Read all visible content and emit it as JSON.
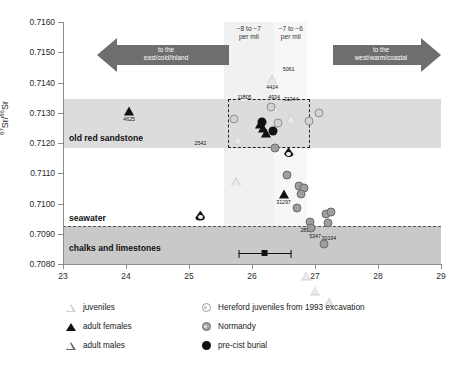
{
  "chart_data": {
    "type": "scatter",
    "title": "",
    "xlabel": "",
    "ylabel": "87Sr/86Sr",
    "ylabel_parts": {
      "pre1": "87",
      "main1": "Sr",
      "sep": "/ ",
      "pre2": "86",
      "main2": "Sr"
    },
    "xlim": [
      23,
      29
    ],
    "ylim": [
      0.708,
      0.716
    ],
    "xticks": [
      "23",
      "24",
      "25",
      "26",
      "27",
      "28",
      "29"
    ],
    "xtick_values": [
      23,
      24,
      25,
      26,
      27,
      28,
      29
    ],
    "yticks": [
      "0.7080",
      "0.7090",
      "0.7100",
      "0.7110",
      "0.7120",
      "0.7130",
      "0.7140",
      "0.7150",
      "0.7160"
    ],
    "ytick_values": [
      0.708,
      0.709,
      0.71,
      0.711,
      0.712,
      0.713,
      0.714,
      0.715,
      0.716
    ],
    "grid": false,
    "legend_position": "below-plot",
    "bands": [
      {
        "name": "old red sandstone",
        "label": "old red sandstone",
        "axis": "y",
        "from": 0.71185,
        "to": 0.71345,
        "color": "#dcdcdc"
      },
      {
        "name": "chalks and limestones",
        "label": "chalks and limestones",
        "axis": "y",
        "from": 0.708,
        "to": 0.70925,
        "color": "#c9c9c9"
      }
    ],
    "vertical_bands": [
      {
        "name": "band -8 to -7",
        "label_line1": "−8 to −7",
        "label_line2": "per mil",
        "from": 25.55,
        "to": 26.35
      },
      {
        "name": "band -7 to -6",
        "label_line1": "−7 to −6",
        "label_line2": "per mil",
        "from": 26.35,
        "to": 26.88
      }
    ],
    "reference_lines": [
      {
        "name": "seawater",
        "label": "seawater",
        "axis": "y",
        "value": 0.70925,
        "style": "dashed"
      }
    ],
    "annotations": [
      {
        "name": "arrow-east",
        "text_line1": "to the",
        "text_line2": "east/cold/inland",
        "direction": "left"
      },
      {
        "name": "arrow-west",
        "text_line1": "to the",
        "text_line2": "west/warm/coastal",
        "direction": "right"
      }
    ],
    "cluster_box": {
      "x0": 25.62,
      "x1": 26.92,
      "y0": 0.71185,
      "y1": 0.71345
    },
    "error_bar": {
      "x": 26.2,
      "y": 0.70836,
      "x_low": 25.78,
      "x_high": 26.62
    },
    "series": [
      {
        "name": "juveniles",
        "marker": "triangle-open-light",
        "points": [
          {
            "x": 26.32,
            "y": 0.7141,
            "label": "4424"
          },
          {
            "x": 25.88,
            "y": 0.7138,
            "label": "11805"
          },
          {
            "x": 26.35,
            "y": 0.71378,
            "label": "4934"
          },
          {
            "x": 26.62,
            "y": 0.71372,
            "label": "31344"
          },
          {
            "x": 25.78,
            "y": 0.7133,
            "label": ""
          },
          {
            "x": 25.75,
            "y": 0.71222,
            "label": ""
          },
          {
            "x": 26.86,
            "y": 0.7094,
            "label": "2857"
          },
          {
            "x": 27.0,
            "y": 0.7092,
            "label": "5347"
          },
          {
            "x": 27.22,
            "y": 0.70912,
            "label": "30194"
          }
        ]
      },
      {
        "name": "adult females",
        "marker": "triangle-solid",
        "points": [
          {
            "x": 24.05,
            "y": 0.71305,
            "label": "4625"
          },
          {
            "x": 26.13,
            "y": 0.71262,
            "label": ""
          },
          {
            "x": 26.18,
            "y": 0.7125,
            "label": ""
          },
          {
            "x": 26.22,
            "y": 0.71232,
            "label": ""
          },
          {
            "x": 26.5,
            "y": 0.7103,
            "label": "31297"
          }
        ]
      },
      {
        "name": "adult males",
        "marker": "drop-solid",
        "points": [
          {
            "x": 25.18,
            "y": 0.71228,
            "label": "2542"
          },
          {
            "x": 26.58,
            "y": 0.7147,
            "label": "5061"
          }
        ]
      },
      {
        "name": "Hereford juveniles from 1993 excavation",
        "marker": "circle-open",
        "points": [
          {
            "x": 25.72,
            "y": 0.71278,
            "label": ""
          },
          {
            "x": 26.3,
            "y": 0.71318,
            "label": ""
          },
          {
            "x": 26.42,
            "y": 0.71265,
            "label": ""
          },
          {
            "x": 26.9,
            "y": 0.71272,
            "label": ""
          },
          {
            "x": 27.06,
            "y": 0.713,
            "label": ""
          }
        ]
      },
      {
        "name": "Normandy",
        "marker": "circle-grey",
        "points": [
          {
            "x": 26.36,
            "y": 0.71182,
            "label": ""
          },
          {
            "x": 26.55,
            "y": 0.71095,
            "label": ""
          },
          {
            "x": 26.74,
            "y": 0.71058,
            "label": ""
          },
          {
            "x": 26.82,
            "y": 0.7105,
            "label": ""
          },
          {
            "x": 26.78,
            "y": 0.7103,
            "label": ""
          },
          {
            "x": 26.72,
            "y": 0.70985,
            "label": ""
          },
          {
            "x": 26.92,
            "y": 0.7094,
            "label": ""
          },
          {
            "x": 26.93,
            "y": 0.70918,
            "label": ""
          },
          {
            "x": 27.18,
            "y": 0.70965,
            "label": ""
          },
          {
            "x": 27.26,
            "y": 0.70972,
            "label": ""
          },
          {
            "x": 27.2,
            "y": 0.70935,
            "label": ""
          },
          {
            "x": 27.14,
            "y": 0.70865,
            "label": ""
          }
        ]
      },
      {
        "name": "pre-cist burial",
        "marker": "circle-solid",
        "points": [
          {
            "x": 26.16,
            "y": 0.71268,
            "label": ""
          },
          {
            "x": 26.34,
            "y": 0.7124,
            "label": ""
          }
        ]
      }
    ]
  },
  "axis": {
    "ylabel_sup1": "87",
    "ylabel_sr1": "Sr",
    "ylabel_slash": "/",
    "ylabel_sup2": "86",
    "ylabel_sr2": "Sr"
  },
  "legend": {
    "items": [
      {
        "key": "juveniles",
        "label": "juveniles",
        "symbol": "triangle-open-icon"
      },
      {
        "key": "adult-females",
        "label": "adult females",
        "symbol": "triangle-solid-icon"
      },
      {
        "key": "adult-males",
        "label": "adult males",
        "symbol": "triangle-outline-icon"
      },
      {
        "key": "hereford",
        "label": "Hereford juveniles from 1993 excavation",
        "symbol": "circle-open-icon"
      },
      {
        "key": "normandy",
        "label": "Normandy",
        "symbol": "circle-grey-icon"
      },
      {
        "key": "pre-cist",
        "label": "pre-cist burial",
        "symbol": "circle-solid-icon"
      }
    ]
  },
  "colors": {
    "band_sandstone": "#dcdcdc",
    "band_chalk": "#c9c9c9",
    "arrow": "#6e6e6e",
    "axis": "#8c8c8c",
    "solid_marker": "#111111"
  }
}
